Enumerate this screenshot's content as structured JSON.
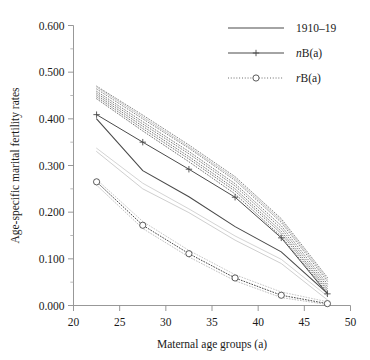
{
  "chart_data": {
    "type": "line",
    "title": "",
    "xlabel": "Maternal age groups (a)",
    "ylabel": "Age-specific marital fertility rates",
    "xlim": [
      20,
      50
    ],
    "ylim": [
      0.0,
      0.6
    ],
    "x_ticks": [
      20,
      25,
      30,
      35,
      40,
      45,
      50
    ],
    "x_tick_labels": [
      "20",
      "25",
      "30",
      "35",
      "40",
      "45",
      "50"
    ],
    "y_ticks": [
      0.0,
      0.1,
      0.2,
      0.3,
      0.4,
      0.5,
      0.6
    ],
    "y_tick_labels": [
      "0.000",
      "0.100",
      "0.200",
      "0.300",
      "0.400",
      "0.500",
      "0.600"
    ],
    "y_minor_ticks": [
      0.05,
      0.15,
      0.25,
      0.35,
      0.45,
      0.55
    ],
    "grid": false,
    "legend_position": "top-right",
    "x": [
      22.5,
      27.5,
      32.5,
      37.5,
      42.5,
      47.5
    ],
    "series": [
      {
        "name": "1910–19",
        "style": "solid",
        "marker": "none",
        "color": "#4a4a4a",
        "width": 1.1,
        "values": [
          0.4,
          0.289,
          0.233,
          0.169,
          0.115,
          0.026
        ]
      },
      {
        "name": "nB(a)",
        "style": "solid",
        "marker": "plus",
        "color": "#4a4a4a",
        "width": 1.0,
        "values": [
          0.409,
          0.35,
          0.292,
          0.232,
          0.145,
          0.025
        ]
      },
      {
        "name": "rB(a)",
        "style": "dotted",
        "marker": "circle",
        "color": "#4a4a4a",
        "width": 1.0,
        "values": [
          0.265,
          0.172,
          0.111,
          0.059,
          0.022,
          0.004
        ]
      }
    ],
    "background_series": [
      {
        "name": "cohort-1",
        "style": "dotted",
        "color": "#707070",
        "values": [
          0.47,
          0.408,
          0.344,
          0.276,
          0.186,
          0.06
        ]
      },
      {
        "name": "cohort-2",
        "style": "dotted",
        "color": "#707070",
        "values": [
          0.464,
          0.4,
          0.337,
          0.268,
          0.178,
          0.052
        ]
      },
      {
        "name": "cohort-3",
        "style": "dotted",
        "color": "#6a6a6a",
        "values": [
          0.459,
          0.394,
          0.33,
          0.261,
          0.171,
          0.046
        ]
      },
      {
        "name": "cohort-4",
        "style": "dotted",
        "color": "#6a6a6a",
        "values": [
          0.455,
          0.389,
          0.325,
          0.256,
          0.165,
          0.041
        ]
      },
      {
        "name": "cohort-5",
        "style": "dotted",
        "color": "#646464",
        "values": [
          0.451,
          0.384,
          0.319,
          0.25,
          0.159,
          0.036
        ]
      },
      {
        "name": "cohort-6",
        "style": "dotted",
        "color": "#646464",
        "values": [
          0.447,
          0.379,
          0.314,
          0.245,
          0.154,
          0.032
        ]
      },
      {
        "name": "cohort-7",
        "style": "dotted",
        "color": "#5e5e5e",
        "values": [
          0.443,
          0.374,
          0.308,
          0.239,
          0.148,
          0.028
        ]
      },
      {
        "name": "cohort-8",
        "style": "solid",
        "color": "#c9c9c9",
        "values": [
          0.468,
          0.404,
          0.34,
          0.272,
          0.182,
          0.056
        ]
      },
      {
        "name": "cohort-9",
        "style": "solid",
        "color": "#cfcfcf",
        "values": [
          0.33,
          0.25,
          0.199,
          0.14,
          0.09,
          0.012
        ]
      },
      {
        "name": "cohort-10",
        "style": "solid",
        "color": "#d4d4d4",
        "values": [
          0.337,
          0.262,
          0.207,
          0.149,
          0.099,
          0.02
        ]
      },
      {
        "name": "cohort-11",
        "style": "dotted",
        "color": "#bdbdbd",
        "values": [
          0.27,
          0.18,
          0.118,
          0.066,
          0.029,
          0.008
        ]
      },
      {
        "name": "cohort-12",
        "style": "dotted",
        "color": "#b5b5b5",
        "values": [
          0.258,
          0.165,
          0.104,
          0.053,
          0.017,
          0.002
        ]
      }
    ]
  },
  "legend": {
    "entries": [
      {
        "label": "1910–19",
        "prefix": "",
        "rest": "1910–19"
      },
      {
        "label": "nB(a)",
        "prefix": "n",
        "rest": "B(a)"
      },
      {
        "label": "rB(a)",
        "prefix": "r",
        "rest": "B(a)"
      }
    ]
  },
  "axes": {
    "x_title": "Maternal age groups (a)",
    "y_title": "Age-specific marital fertility rates"
  }
}
